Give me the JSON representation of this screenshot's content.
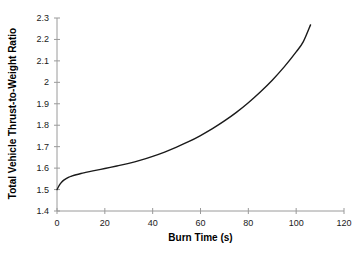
{
  "chart_data": {
    "type": "line",
    "title": "",
    "xlabel": "Burn Time (s)",
    "ylabel": "Total Vehicle Thrust-to-Weight Ratio",
    "xlim": [
      0,
      120
    ],
    "ylim": [
      1.4,
      2.3
    ],
    "grid": false,
    "legend": null,
    "legend_position": "none",
    "xticks": [
      0,
      20,
      40,
      60,
      80,
      100,
      120
    ],
    "xtick_labels": [
      "0",
      "20",
      "40",
      "60",
      "80",
      "100",
      "120"
    ],
    "yticks": [
      1.4,
      1.5,
      1.6,
      1.7,
      1.8,
      1.9,
      2.0,
      2.1,
      2.2,
      2.3
    ],
    "ytick_labels": [
      "1.4",
      "1.5",
      "1.6",
      "1.7",
      "1.8",
      "1.9",
      "2",
      "2.1",
      "2.2",
      "2.3"
    ],
    "line_color": "#1a1a1a",
    "line_width": 1.4,
    "series": [
      {
        "name": "Total Vehicle Thrust-to-Weight Ratio",
        "x": [
          0,
          1,
          2,
          3,
          4,
          5,
          6,
          8,
          10,
          12,
          15,
          20,
          25,
          30,
          35,
          40,
          45,
          50,
          55,
          60,
          65,
          70,
          75,
          80,
          85,
          90,
          95,
          100,
          103,
          106
        ],
        "y": [
          1.5,
          1.521,
          1.535,
          1.545,
          1.552,
          1.558,
          1.562,
          1.569,
          1.575,
          1.58,
          1.587,
          1.598,
          1.61,
          1.622,
          1.637,
          1.655,
          1.675,
          1.698,
          1.723,
          1.752,
          1.784,
          1.82,
          1.86,
          1.905,
          1.955,
          2.01,
          2.072,
          2.142,
          2.19,
          2.268
        ]
      }
    ]
  },
  "axes": {
    "x_title": "Burn Time (s)",
    "y_title": "Total Vehicle Thrust-to-Weight Ratio"
  }
}
